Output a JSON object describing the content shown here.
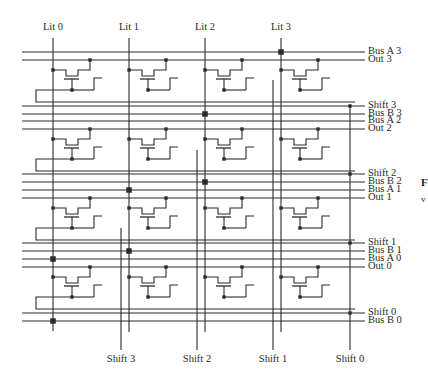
{
  "diagram": {
    "type": "barrel-shifter-crossbar",
    "colors": {
      "line": "#2a2a2a",
      "background": "#ffffff"
    },
    "top_labels": [
      {
        "text": "Lit 0",
        "x": 53
      },
      {
        "text": "Lit 1",
        "x": 129
      },
      {
        "text": "Lit 2",
        "x": 205
      },
      {
        "text": "Lit 3",
        "x": 281
      }
    ],
    "bottom_labels": [
      {
        "text": "Shift 3",
        "x": 121
      },
      {
        "text": "Shift 2",
        "x": 197
      },
      {
        "text": "Shift 1",
        "x": 273
      },
      {
        "text": "Shift 0",
        "x": 350
      }
    ],
    "right_labels": [
      {
        "text": "Bus A 3",
        "y": 52
      },
      {
        "text": "Out 3",
        "y": 60
      },
      {
        "text": "Shift 3",
        "y": 106
      },
      {
        "text": "Bus B 3",
        "y": 114
      },
      {
        "text": "Bus A 2",
        "y": 121
      },
      {
        "text": "Out 2",
        "y": 129
      },
      {
        "text": "Shift 2",
        "y": 174
      },
      {
        "text": "Bus B 2",
        "y": 182
      },
      {
        "text": "Bus A 1",
        "y": 190
      },
      {
        "text": "Out 1",
        "y": 198
      },
      {
        "text": "Shift 1",
        "y": 243
      },
      {
        "text": "Bus B 1",
        "y": 251
      },
      {
        "text": "Bus A 0",
        "y": 259
      },
      {
        "text": "Out 0",
        "y": 267
      },
      {
        "text": "Shift 0",
        "y": 313
      },
      {
        "text": "Bus B 0",
        "y": 321
      }
    ],
    "edge_fragment": {
      "letter": "F",
      "sub": "v"
    }
  }
}
